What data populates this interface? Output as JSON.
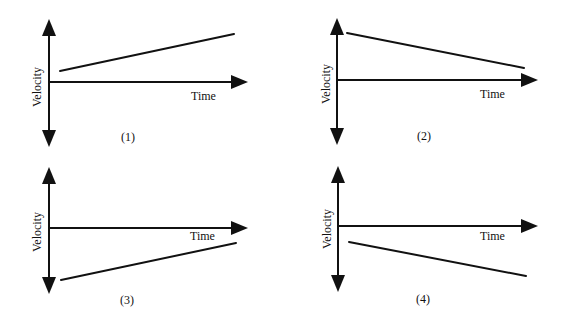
{
  "diagram": {
    "type": "velocity-time graphs",
    "panels": [
      {
        "id": "1",
        "caption": "(1)",
        "y_axis_label": "Velocity",
        "x_axis_label": "Time",
        "line": {
          "description": "positive velocity, increasing",
          "start_sign": "positive",
          "end_sign": "positive",
          "trend": "increasing"
        }
      },
      {
        "id": "2",
        "caption": "(2)",
        "y_axis_label": "Velocity",
        "x_axis_label": "Time",
        "line": {
          "description": "positive velocity, decreasing",
          "start_sign": "positive",
          "end_sign": "positive",
          "trend": "decreasing"
        }
      },
      {
        "id": "3",
        "caption": "(3)",
        "y_axis_label": "Velocity",
        "x_axis_label": "Time",
        "line": {
          "description": "negative velocity, increasing toward zero",
          "start_sign": "negative",
          "end_sign": "negative",
          "trend": "increasing"
        }
      },
      {
        "id": "4",
        "caption": "(4)",
        "y_axis_label": "Velocity",
        "x_axis_label": "Time",
        "line": {
          "description": "negative velocity, decreasing",
          "start_sign": "negative",
          "end_sign": "negative",
          "trend": "decreasing"
        }
      }
    ]
  },
  "colors": {
    "ink": "#111111",
    "background": "#ffffff"
  }
}
